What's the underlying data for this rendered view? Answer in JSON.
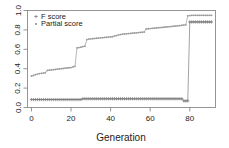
{
  "chart_data": {
    "type": "line",
    "title": "",
    "subtitle": "",
    "xlabel": "Generation",
    "ylabel": "",
    "xlim": [
      -2,
      93
    ],
    "ylim": [
      0.0,
      1.0
    ],
    "xticks": [
      0,
      20,
      40,
      60,
      80
    ],
    "xtick_labels": [
      "0",
      "20",
      "40",
      "60",
      "80"
    ],
    "yticks": [
      0.0,
      0.2,
      0.4,
      0.6,
      0.8,
      1.0
    ],
    "ytick_labels": [
      "0.0",
      "0.2",
      "0.4",
      "0.6",
      "0.8",
      "1.0"
    ],
    "grid": false,
    "legend_position": "top-left",
    "legend": [
      {
        "label": "F score",
        "marker": "plus",
        "color": "#7a7a7a"
      },
      {
        "label": "Partial score",
        "marker": "dot",
        "color": "#7a7a7a"
      }
    ],
    "series": [
      {
        "name": "F score",
        "marker": "plus",
        "color": "#7a7a7a",
        "x": [
          0,
          1,
          2,
          3,
          4,
          5,
          6,
          7,
          8,
          9,
          10,
          11,
          12,
          13,
          14,
          15,
          16,
          17,
          18,
          19,
          20,
          21,
          22,
          23,
          24,
          25,
          26,
          27,
          28,
          29,
          30,
          31,
          32,
          33,
          34,
          35,
          36,
          37,
          38,
          39,
          40,
          41,
          42,
          43,
          44,
          45,
          46,
          47,
          48,
          49,
          50,
          51,
          52,
          53,
          54,
          55,
          56,
          57,
          58,
          59,
          60,
          61,
          62,
          63,
          64,
          65,
          66,
          67,
          68,
          69,
          70,
          71,
          72,
          73,
          74,
          75,
          76,
          77,
          78,
          79,
          80,
          81,
          82,
          83,
          84,
          85,
          86,
          87,
          88,
          89,
          90,
          91
        ],
        "y": [
          0.082,
          0.082,
          0.082,
          0.082,
          0.082,
          0.082,
          0.082,
          0.082,
          0.082,
          0.082,
          0.082,
          0.082,
          0.082,
          0.082,
          0.082,
          0.082,
          0.082,
          0.082,
          0.082,
          0.082,
          0.082,
          0.082,
          0.082,
          0.082,
          0.082,
          0.082,
          0.09,
          0.09,
          0.09,
          0.09,
          0.09,
          0.09,
          0.09,
          0.09,
          0.09,
          0.09,
          0.09,
          0.09,
          0.09,
          0.09,
          0.09,
          0.09,
          0.09,
          0.09,
          0.09,
          0.09,
          0.09,
          0.09,
          0.09,
          0.09,
          0.09,
          0.09,
          0.09,
          0.09,
          0.09,
          0.09,
          0.09,
          0.09,
          0.09,
          0.09,
          0.09,
          0.09,
          0.09,
          0.09,
          0.09,
          0.09,
          0.09,
          0.09,
          0.09,
          0.09,
          0.09,
          0.09,
          0.09,
          0.09,
          0.09,
          0.09,
          0.09,
          0.068,
          0.068,
          0.068,
          0.882,
          0.882,
          0.882,
          0.882,
          0.882,
          0.882,
          0.882,
          0.882,
          0.882,
          0.882,
          0.882,
          0.882
        ]
      },
      {
        "name": "Partial score",
        "marker": "dot",
        "color": "#9a9a9a",
        "x": [
          0,
          1,
          2,
          3,
          4,
          5,
          6,
          7,
          8,
          9,
          10,
          11,
          12,
          13,
          14,
          15,
          16,
          17,
          18,
          19,
          20,
          21,
          22,
          23,
          24,
          25,
          26,
          27,
          28,
          29,
          30,
          31,
          32,
          33,
          34,
          35,
          36,
          37,
          38,
          39,
          40,
          41,
          42,
          43,
          44,
          45,
          46,
          47,
          48,
          49,
          50,
          51,
          52,
          53,
          54,
          55,
          56,
          57,
          58,
          59,
          60,
          61,
          62,
          63,
          64,
          65,
          66,
          67,
          68,
          69,
          70,
          71,
          72,
          73,
          74,
          75,
          76,
          77,
          78,
          79,
          80,
          81,
          82,
          83,
          84,
          85,
          86,
          87,
          88,
          89,
          90,
          91
        ],
        "y": [
          0.325,
          0.33,
          0.338,
          0.345,
          0.35,
          0.352,
          0.355,
          0.358,
          0.382,
          0.385,
          0.388,
          0.39,
          0.392,
          0.395,
          0.398,
          0.4,
          0.402,
          0.405,
          0.408,
          0.41,
          0.412,
          0.418,
          0.425,
          0.615,
          0.618,
          0.622,
          0.628,
          0.632,
          0.7,
          0.705,
          0.708,
          0.71,
          0.712,
          0.714,
          0.716,
          0.718,
          0.72,
          0.722,
          0.724,
          0.726,
          0.728,
          0.73,
          0.738,
          0.742,
          0.748,
          0.752,
          0.756,
          0.758,
          0.76,
          0.762,
          0.764,
          0.766,
          0.768,
          0.77,
          0.772,
          0.774,
          0.776,
          0.778,
          0.81,
          0.812,
          0.814,
          0.816,
          0.818,
          0.82,
          0.822,
          0.824,
          0.826,
          0.828,
          0.83,
          0.832,
          0.834,
          0.836,
          0.838,
          0.84,
          0.842,
          0.845,
          0.848,
          0.85,
          0.852,
          0.945,
          0.948,
          0.95,
          0.95,
          0.95,
          0.95,
          0.95,
          0.95,
          0.95,
          0.95,
          0.95,
          0.95,
          0.95
        ]
      }
    ],
    "annotations": [
      {
        "text": "step increase at generation 22",
        "x": 22,
        "y": 0.62
      },
      {
        "text": "sharp jump of F score at generation 80",
        "x": 80,
        "y": 0.88
      }
    ]
  },
  "axes": {
    "x_title": "Generation"
  }
}
